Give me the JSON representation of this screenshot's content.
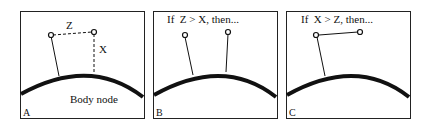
{
  "figure": {
    "panels": [
      {
        "id": "A",
        "label": "A",
        "body_label": "Body node",
        "z_label": "Z",
        "x_label": "X",
        "caption": ""
      },
      {
        "id": "B",
        "label": "B",
        "caption": "If  Z > X, then..."
      },
      {
        "id": "C",
        "label": "C",
        "caption": "If  X > Z, then..."
      }
    ],
    "colors": {
      "stroke": "#111111",
      "background": "#ffffff"
    }
  }
}
